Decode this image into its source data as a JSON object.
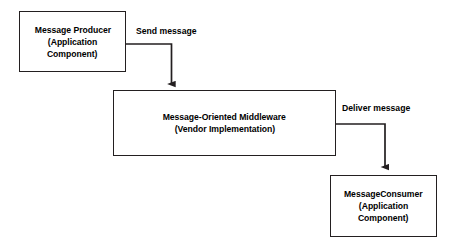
{
  "diagram": {
    "background_color": "#ffffff",
    "stroke_color": "#231f20",
    "text_color": "#000000",
    "nodes": [
      {
        "id": "producer",
        "lines": [
          "Message Producer",
          "(Application",
          "Component)"
        ]
      },
      {
        "id": "middleware",
        "lines": [
          "Message-Oriented Middleware",
          "(Vendor Implementation)"
        ]
      },
      {
        "id": "consumer",
        "lines": [
          "MessageConsumer",
          "(Application",
          "Component)"
        ]
      }
    ],
    "edges": [
      {
        "id": "send",
        "label": "Send message",
        "from": "producer",
        "to": "middleware"
      },
      {
        "id": "deliver",
        "label": "Deliver message",
        "from": "middleware",
        "to": "consumer"
      }
    ]
  }
}
